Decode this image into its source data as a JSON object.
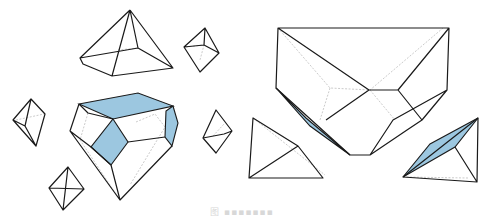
{
  "figure": {
    "highlight_color": "#9cc7e0",
    "edge_color": "#1a1a1a",
    "hidden_edge_color": "#b5b5b5",
    "caption": "图 ▪▪▪▪▪▪▪"
  },
  "shapes": [
    {
      "name": "square-pyramid-top"
    },
    {
      "name": "small-octahedron-top-right"
    },
    {
      "name": "small-octahedron-left"
    },
    {
      "name": "central-polyhedron-highlighted"
    },
    {
      "name": "small-octahedron-right"
    },
    {
      "name": "small-octahedron-bottom"
    },
    {
      "name": "large-polyhedron-right"
    },
    {
      "name": "tetrahedron-bottom-left"
    },
    {
      "name": "tetrahedron-bottom-right-highlighted"
    }
  ]
}
